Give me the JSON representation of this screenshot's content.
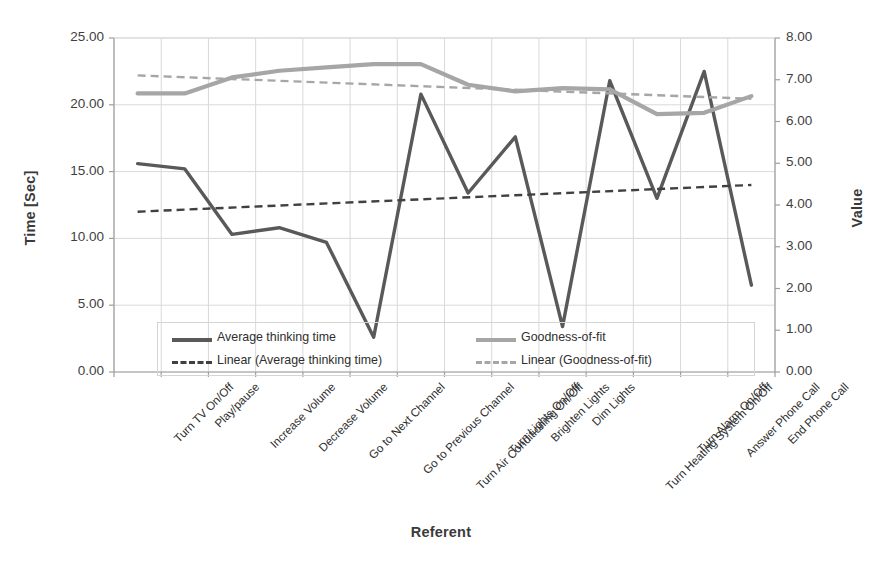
{
  "chart_data": {
    "type": "line",
    "title": "",
    "xlabel": "Referent",
    "ylabel": "Time [Sec]",
    "ylabel_secondary": "Value",
    "ylim": [
      0,
      25
    ],
    "ylim_secondary": [
      0,
      8
    ],
    "grid": true,
    "legend_position": "inside-bottom",
    "categories": [
      "Turn TV On/Off",
      "Play/pause",
      "Increase Volume",
      "Decrease Volume",
      "Go to Next Channel",
      "Go to Previous Channel",
      "Turn Air Conditioning On/Off",
      "Turn Lights On/Off",
      "Brighten Lights",
      "Dim Lights",
      "Turn Heating System On/Off",
      "Turn Alarm On/Off",
      "Answer Phone Call",
      "End Phone Call"
    ],
    "series": [
      {
        "name": "Average thinking time",
        "axis": "left",
        "style": "solid",
        "color": "#595959",
        "values": [
          15.6,
          15.2,
          10.3,
          10.8,
          9.7,
          2.6,
          20.8,
          13.4,
          17.6,
          3.4,
          21.8,
          13.0,
          22.5,
          6.5
        ]
      },
      {
        "name": "Goodness-of-fit",
        "axis": "right",
        "style": "solid",
        "color": "#a6a6a6",
        "values": [
          6.67,
          6.67,
          7.05,
          7.22,
          7.3,
          7.37,
          7.37,
          6.88,
          6.72,
          6.8,
          6.76,
          6.18,
          6.2,
          6.6
        ],
        "values_left_scale": [
          20.85,
          20.85,
          22.05,
          22.55,
          22.8,
          23.05,
          23.05,
          21.5,
          21.0,
          21.25,
          21.15,
          19.3,
          19.4,
          20.65
        ]
      },
      {
        "name": "Linear (Average thinking time)",
        "axis": "left",
        "style": "dashed",
        "color": "#404040",
        "trend_endpoints": [
          12.0,
          14.0
        ]
      },
      {
        "name": "Linear (Goodness-of-fit)",
        "axis": "right",
        "style": "dashed",
        "color": "#a6a6a6",
        "trend_endpoints": [
          7.1,
          6.55
        ],
        "trend_endpoints_left_scale": [
          22.2,
          20.45
        ]
      }
    ],
    "yticks_left": [
      "0.00",
      "5.00",
      "10.00",
      "15.00",
      "20.00",
      "25.00"
    ],
    "yticks_right": [
      "0.00",
      "1.00",
      "2.00",
      "3.00",
      "4.00",
      "5.00",
      "6.00",
      "7.00",
      "8.00"
    ]
  },
  "legend": {
    "items": [
      {
        "label": "Average thinking time",
        "style": "solid",
        "color": "#595959"
      },
      {
        "label": "Linear (Average thinking time)",
        "style": "dashed",
        "color": "#404040"
      },
      {
        "label": "Goodness-of-fit",
        "style": "solid",
        "color": "#a6a6a6"
      },
      {
        "label": "Linear (Goodness-of-fit)",
        "style": "dashed",
        "color": "#a6a6a6"
      }
    ]
  }
}
